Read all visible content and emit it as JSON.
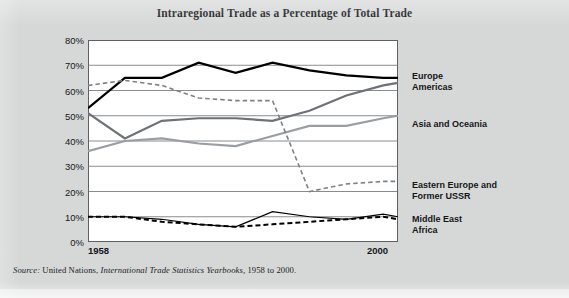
{
  "figure": {
    "title": "Intraregional Trade as a Percentage of Total Trade",
    "background_color": "#d6d8d7",
    "plot_background_color": "#ffffff"
  },
  "axis": {
    "x_start_label": "1958",
    "x_end_label": "2000",
    "y_ticks": [
      "80%",
      "70%",
      "60%",
      "50%",
      "40%",
      "30%",
      "20%",
      "10%",
      "0%"
    ]
  },
  "legend": {
    "europe": "Europe",
    "americas": "Americas",
    "asia_oceania": "Asia and Oceania",
    "eastern_europe": "Eastern Europe and\nFormer USSR",
    "middle_east": "Middle East",
    "africa": "Africa"
  },
  "source": {
    "prefix": "Source:",
    "publisher": "United Nations,",
    "publication": "International Trade Statistics Yearbooks,",
    "years": "1958 to 2000."
  },
  "chart_data": {
    "type": "line",
    "title": "Intraregional Trade as a Percentage of Total Trade",
    "xlabel": "",
    "ylabel": "",
    "xlim": [
      1958,
      2000
    ],
    "ylim": [
      0,
      80
    ],
    "ytick_step": 10,
    "grid": true,
    "grid_axis": "y",
    "legend_position": "right-inline",
    "x": [
      1958,
      1963,
      1968,
      1973,
      1978,
      1983,
      1988,
      1993,
      1998,
      2000
    ],
    "series": [
      {
        "name": "Europe",
        "color": "#000000",
        "style": "solid",
        "width": 2.2,
        "values": [
          53,
          65,
          65,
          71,
          67,
          71,
          68,
          66,
          65,
          65
        ]
      },
      {
        "name": "Americas",
        "color": "#6e7175",
        "style": "solid",
        "width": 2.2,
        "values": [
          51,
          41,
          48,
          49,
          49,
          48,
          52,
          58,
          62,
          63
        ]
      },
      {
        "name": "Asia and Oceania",
        "color": "#9a9da1",
        "style": "solid",
        "width": 2.2,
        "values": [
          36,
          40,
          41,
          39,
          38,
          42,
          46,
          46,
          49,
          50
        ]
      },
      {
        "name": "Eastern Europe and Former USSR",
        "color": "#7d8084",
        "style": "dashed",
        "width": 1.6,
        "values": [
          62,
          64,
          62,
          57,
          56,
          56,
          20,
          23,
          24,
          24
        ]
      },
      {
        "name": "Middle East",
        "color": "#000000",
        "style": "solid",
        "width": 1.2,
        "values": [
          10,
          10,
          9,
          7,
          6,
          12,
          10,
          9,
          11,
          10
        ]
      },
      {
        "name": "Africa",
        "color": "#000000",
        "style": "dashed",
        "width": 2.0,
        "values": [
          10,
          10,
          8,
          7,
          6,
          7,
          8,
          9,
          10,
          9
        ]
      }
    ]
  }
}
